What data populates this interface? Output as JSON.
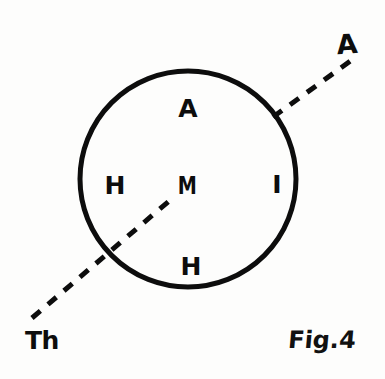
{
  "figure": {
    "caption": "Fig.4",
    "background_color": "#fdfdfc",
    "ink_color": "#0d0d0d",
    "circle": {
      "name": "main-circle",
      "center_x": 188,
      "center_y": 179,
      "radius": 108,
      "stroke_width": 5
    },
    "interior_labels": [
      {
        "text": "A",
        "x": 188,
        "y": 108,
        "position": "top"
      },
      {
        "text": "H",
        "x": 115,
        "y": 185,
        "position": "left"
      },
      {
        "text": "M",
        "x": 187,
        "y": 186,
        "position": "center"
      },
      {
        "text": "I",
        "x": 277,
        "y": 184,
        "position": "right"
      },
      {
        "text": "H",
        "x": 191,
        "y": 266,
        "position": "bottom"
      }
    ],
    "axis_line": {
      "name": "dashed-axis",
      "style": "dashed",
      "stroke_width": 5,
      "dash_pattern": "11 10",
      "lower_label": "Th",
      "upper_label": "A",
      "lower_end_x": 32,
      "lower_end_y": 318,
      "center_stop_x": 175,
      "center_stop_y": 196,
      "resume_x": 273,
      "resume_y": 117,
      "upper_end_x": 356,
      "upper_end_y": 57
    },
    "end_labels": [
      {
        "text": "Th",
        "x": 42,
        "y": 340,
        "name": "label-th"
      },
      {
        "text": "A",
        "x": 347,
        "y": 44,
        "name": "label-a-axis"
      }
    ]
  }
}
